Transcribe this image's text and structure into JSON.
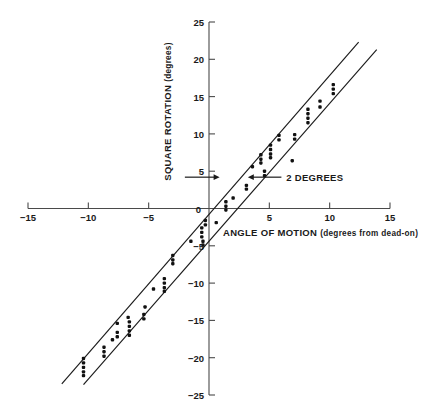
{
  "chart_data": {
    "type": "scatter",
    "title": "",
    "xlabel": "ANGLE OF MOTION (degrees from dead-on)",
    "ylabel": "SQUARE ROTATION (degrees)",
    "xlabel_main": "ANGLE OF MOTION",
    "xlabel_paren": "(degrees from dead-on)",
    "ylabel_main": "SQUARE ROTATION",
    "ylabel_paren": "(degrees)",
    "xlim": [
      -15,
      15
    ],
    "ylim": [
      -25,
      25
    ],
    "xticks": [
      -15,
      -10,
      -5,
      5,
      10,
      15
    ],
    "yticks": [
      25,
      20,
      15,
      10,
      5,
      0,
      -5,
      -10,
      -15,
      -20,
      -25
    ],
    "xtick_labels": [
      "-15",
      "-10",
      "-5",
      "5",
      "10",
      "15"
    ],
    "ytick_labels": [
      "25",
      "20",
      "15",
      "10",
      "5",
      "0",
      "-5",
      "-10",
      "-15",
      "-20",
      "-25"
    ],
    "grid": false,
    "legend": null,
    "axis_style": "crossed-at-origin",
    "annotations": [
      {
        "label": "2 DEGREES",
        "description": "double arrow marking the 2 degree horizontal offset between the two fitted lines",
        "x": 6.2,
        "y": 4.2
      }
    ],
    "series": [
      {
        "name": "upper fit line",
        "type": "line",
        "x": [
          -12.2,
          12.4
        ],
        "y": [
          -23.5,
          22.3
        ]
      },
      {
        "name": "lower fit line",
        "type": "line",
        "x": [
          -10.4,
          13.9
        ],
        "y": [
          -23.6,
          21.3
        ]
      },
      {
        "name": "observations",
        "type": "scatter",
        "points": [
          [
            -10.4,
            -20.1
          ],
          [
            -10.4,
            -20.7
          ],
          [
            -10.4,
            -21.3
          ],
          [
            -10.4,
            -21.9
          ],
          [
            -10.4,
            -22.4
          ],
          [
            -8.7,
            -18.6
          ],
          [
            -8.7,
            -19.2
          ],
          [
            -8.7,
            -19.8
          ],
          [
            -7.6,
            -16.6
          ],
          [
            -7.6,
            -17.2
          ],
          [
            -7.6,
            -15.4
          ],
          [
            -8.0,
            -17.6
          ],
          [
            -6.6,
            -15.2
          ],
          [
            -6.6,
            -15.8
          ],
          [
            -6.6,
            -16.4
          ],
          [
            -6.6,
            -17.0
          ],
          [
            -6.7,
            -14.6
          ],
          [
            -5.4,
            -14.2
          ],
          [
            -5.4,
            -14.8
          ],
          [
            -5.3,
            -13.2
          ],
          [
            -4.6,
            -10.8
          ],
          [
            -3.7,
            -9.4
          ],
          [
            -3.7,
            -10.0
          ],
          [
            -3.7,
            -10.6
          ],
          [
            -3.7,
            -11.1
          ],
          [
            -3.0,
            -6.3
          ],
          [
            -3.0,
            -6.9
          ],
          [
            -3.0,
            -7.4
          ],
          [
            -1.5,
            -4.4
          ],
          [
            -0.6,
            -2.6
          ],
          [
            -0.6,
            -3.2
          ],
          [
            -0.6,
            -3.8
          ],
          [
            -0.5,
            -4.4
          ],
          [
            -0.5,
            -4.9
          ],
          [
            -0.3,
            -1.6
          ],
          [
            -0.3,
            -2.2
          ],
          [
            0.6,
            -1.9
          ],
          [
            1.4,
            -0.2
          ],
          [
            1.4,
            0.3
          ],
          [
            1.4,
            0.9
          ],
          [
            2.0,
            1.4
          ],
          [
            3.1,
            2.6
          ],
          [
            3.1,
            3.1
          ],
          [
            3.6,
            5.6
          ],
          [
            4.6,
            4.4
          ],
          [
            4.6,
            5.0
          ],
          [
            4.3,
            6.1
          ],
          [
            4.3,
            6.6
          ],
          [
            4.3,
            7.2
          ],
          [
            5.1,
            6.8
          ],
          [
            5.1,
            7.3
          ],
          [
            5.1,
            7.9
          ],
          [
            5.1,
            8.5
          ],
          [
            5.8,
            9.2
          ],
          [
            5.8,
            9.8
          ],
          [
            6.9,
            6.4
          ],
          [
            7.1,
            9.3
          ],
          [
            7.1,
            9.9
          ],
          [
            8.2,
            11.5
          ],
          [
            8.2,
            12.1
          ],
          [
            8.2,
            12.7
          ],
          [
            8.2,
            13.3
          ],
          [
            9.2,
            13.6
          ],
          [
            9.2,
            14.4
          ],
          [
            10.3,
            15.4
          ],
          [
            10.3,
            16.0
          ],
          [
            10.3,
            16.6
          ]
        ]
      }
    ]
  }
}
